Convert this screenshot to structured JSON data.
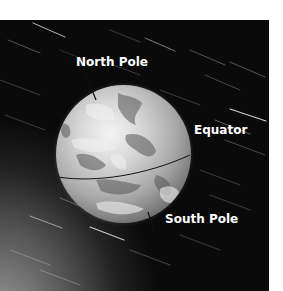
{
  "figure": {
    "labels": {
      "north_pole": "North Pole",
      "equator": "Equator",
      "south_pole": "South Pole"
    },
    "colors": {
      "label_text": "#ffffff",
      "pointer_line": "#111111",
      "background_dark": "#0a0a0a"
    }
  }
}
